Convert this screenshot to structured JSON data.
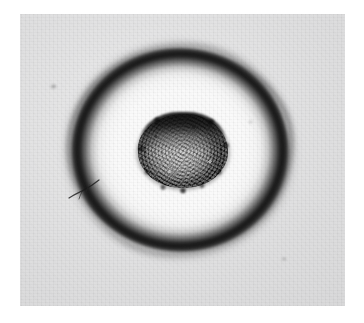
{
  "figure": {
    "kind": "grayscale-micrograph",
    "subject_label": "ring-shaped colony with dense central core",
    "palette": {
      "page_background": "#ffffff",
      "plate_background": "#d9d9da",
      "halo_interior": "#fafafa",
      "ring_dark": "#1a1a1a",
      "core_center": "#a9a9a9",
      "core_rim": "#171717"
    },
    "plate": {
      "left": 20,
      "top": 14,
      "width": 325,
      "height": 292
    },
    "structures": [
      {
        "id": "outer-ring",
        "label": "outer dark ring",
        "center_x": 180,
        "center_y": 150,
        "radius_x": 110,
        "radius_y": 103,
        "rim_thickness": 8,
        "tone": "#1a1a1a",
        "edge": "fuzzy, slightly polygonal"
      },
      {
        "id": "clear-zone",
        "label": "bright interior clearing",
        "center_x": 180,
        "center_y": 150,
        "radius_x": 93,
        "radius_y": 86,
        "tone": "#fafafa"
      },
      {
        "id": "central-core",
        "label": "mottled central core",
        "center_x": 183,
        "center_y": 151,
        "radius_x": 45,
        "radius_y": 37,
        "tone_center": "#a9a9a9",
        "tone_edge": "#171717",
        "texture": "granular speckle, darker cap on upper edge"
      }
    ],
    "artifacts": [
      {
        "id": "hair",
        "label": "hair or scratch on plate",
        "x": 66,
        "y": 178,
        "width": 34,
        "height": 22
      },
      {
        "id": "speck-upper-left",
        "label": "dust speck",
        "x": 50,
        "y": 84,
        "width": 7,
        "height": 5
      },
      {
        "id": "speck-lower-right",
        "label": "dust speck",
        "x": 281,
        "y": 257,
        "width": 6,
        "height": 4
      },
      {
        "id": "speck-mid-right",
        "label": "dust speck",
        "x": 248,
        "y": 120,
        "width": 5,
        "height": 4
      }
    ],
    "notes": "No text, axes, scale bar, legend or labels are present in the image."
  }
}
